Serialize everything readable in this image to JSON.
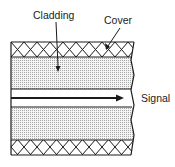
{
  "diagram": {
    "labels": {
      "cladding": "Cladding",
      "cover": "Cover",
      "signal": "Signal"
    },
    "colors": {
      "line": "#1a1a1a",
      "dots": "#9a9a9a",
      "background": "#ffffff"
    }
  }
}
